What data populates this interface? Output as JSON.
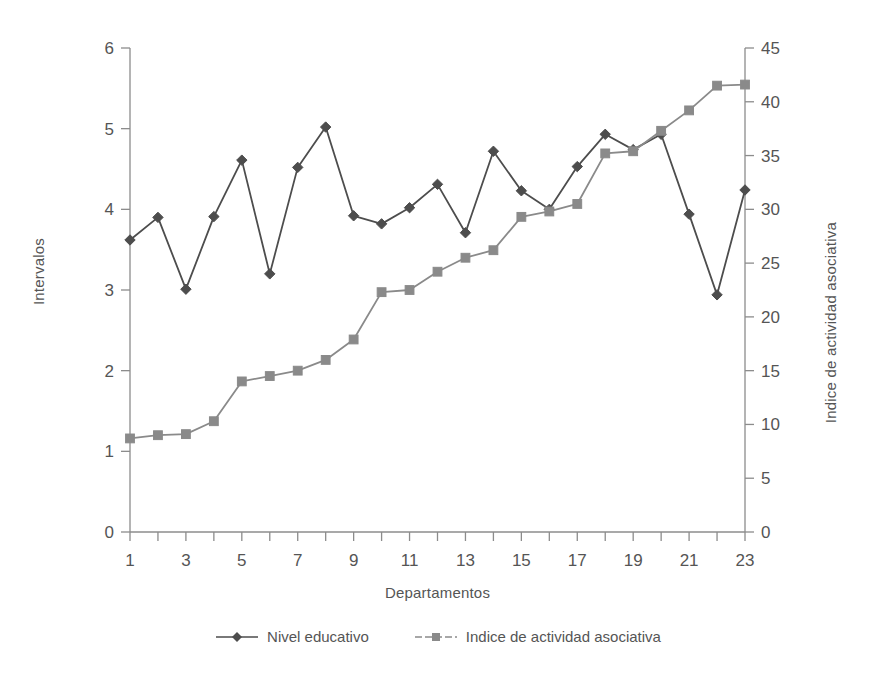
{
  "chart_data": {
    "type": "line",
    "title": "",
    "xlabel": "Departamentos",
    "ylabel": "Intervalos",
    "ylabel_right": "Indice de actividad asociativa",
    "grid": false,
    "legend_position": "bottom",
    "x": [
      1,
      2,
      3,
      4,
      5,
      6,
      7,
      8,
      9,
      10,
      11,
      12,
      13,
      14,
      15,
      16,
      17,
      18,
      19,
      20,
      21,
      22,
      23
    ],
    "categories": [
      "1",
      "2",
      "3",
      "4",
      "5",
      "6",
      "7",
      "8",
      "9",
      "10",
      "11",
      "12",
      "13",
      "14",
      "15",
      "16",
      "17",
      "18",
      "19",
      "20",
      "21",
      "22",
      "23"
    ],
    "xtick_labels": [
      "1",
      "3",
      "5",
      "7",
      "9",
      "11",
      "13",
      "15",
      "17",
      "19",
      "21",
      "23"
    ],
    "xtick_values": [
      1,
      3,
      5,
      7,
      9,
      11,
      13,
      15,
      17,
      19,
      21,
      23
    ],
    "xlim": [
      0,
      24
    ],
    "ylim": [
      0,
      6
    ],
    "ytick_labels": [
      "0",
      "1",
      "2",
      "3",
      "4",
      "5",
      "6"
    ],
    "ytick_values": [
      0,
      1,
      2,
      3,
      4,
      5,
      6
    ],
    "ylim_right": [
      0,
      45
    ],
    "ytick_labels_right": [
      "0",
      "5",
      "10",
      "15",
      "20",
      "25",
      "30",
      "35",
      "40",
      "45"
    ],
    "ytick_values_right": [
      0,
      5,
      10,
      15,
      20,
      25,
      30,
      35,
      40,
      45
    ],
    "series": [
      {
        "name": "Nivel educativo",
        "axis": "left",
        "marker": "diamond",
        "color": "#4d4d4d",
        "values": [
          3.62,
          3.9,
          3.01,
          3.91,
          4.61,
          3.2,
          4.52,
          5.02,
          3.92,
          3.82,
          4.02,
          4.31,
          3.71,
          4.72,
          4.23,
          4.0,
          4.53,
          4.93,
          4.74,
          4.93,
          3.94,
          2.94,
          4.24
        ]
      },
      {
        "name": "Indice de actividad asociativa",
        "axis": "right",
        "marker": "square",
        "color": "#8a8a8a",
        "values": [
          8.7,
          9.0,
          9.1,
          10.3,
          14.0,
          14.5,
          15.0,
          16.0,
          17.9,
          22.3,
          22.5,
          24.2,
          25.5,
          26.2,
          29.3,
          29.8,
          30.5,
          35.2,
          35.4,
          37.3,
          39.2,
          41.5,
          41.6
        ]
      }
    ]
  },
  "legend": {
    "items": [
      {
        "label": "Nivel educativo"
      },
      {
        "label": "Indice de actividad asociativa"
      }
    ]
  },
  "axes": {
    "left_title": "Intervalos",
    "right_title": "Indice de actividad asociativa",
    "bottom_title": "Departamentos"
  },
  "colors": {
    "series1": "#4d4d4d",
    "series2": "#8a8a8a",
    "axis": "#8c8c8c",
    "text": "#555555",
    "background": "#ffffff"
  }
}
